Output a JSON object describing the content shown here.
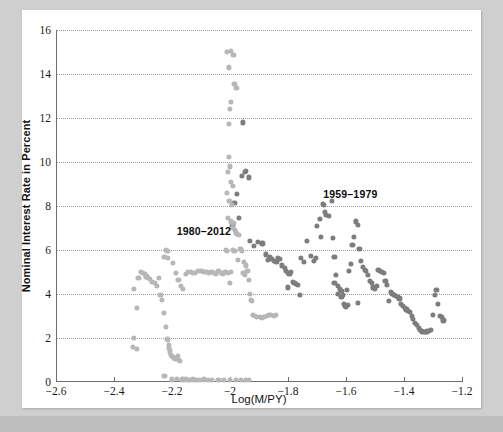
{
  "chart_data": {
    "type": "scatter",
    "title": "",
    "xlabel": "Log(M/PY)",
    "ylabel": "Nominal Interest Rate in Percent",
    "xlim": [
      -2.6,
      -1.2
    ],
    "ylim": [
      0,
      16
    ],
    "xticks": [
      -2.6,
      -2.4,
      -2.2,
      -2.0,
      -1.8,
      -1.6,
      -1.4,
      -1.2
    ],
    "xtick_labels": [
      "−2.6",
      "−2.4",
      "−2.2",
      "−2",
      "−1.8",
      "−1.6",
      "−1.4",
      "−1.2"
    ],
    "yticks": [
      0,
      2,
      4,
      6,
      8,
      10,
      12,
      14,
      16
    ],
    "ytick_labels": [
      "0",
      "2",
      "4",
      "6",
      "8",
      "10",
      "12",
      "14",
      "16"
    ],
    "grid": "horizontal-dotted",
    "legend_position": "inline-annotations",
    "annotations": [
      {
        "text": "1980–2012",
        "x": -2.09,
        "y": 6.85,
        "color": "#0d0d0d"
      },
      {
        "text": "1959–1979",
        "x": -1.585,
        "y": 8.55,
        "color": "#0d0d0d"
      }
    ],
    "series": [
      {
        "name": "1959–1979",
        "color": "#7d7d7d",
        "points": [
          [
            -1.955,
            11.8
          ],
          [
            -1.945,
            9.6
          ],
          [
            -1.95,
            9.55
          ],
          [
            -1.96,
            9.35
          ],
          [
            -1.935,
            9.3
          ],
          [
            -1.975,
            8.55
          ],
          [
            -1.985,
            8.15
          ],
          [
            -1.97,
            7.45
          ],
          [
            -1.992,
            7.1
          ],
          [
            -1.93,
            6.4
          ],
          [
            -1.905,
            6.35
          ],
          [
            -1.918,
            6.2
          ],
          [
            -1.888,
            6.3
          ],
          [
            -1.875,
            5.8
          ],
          [
            -1.862,
            5.7
          ],
          [
            -1.855,
            5.6
          ],
          [
            -1.868,
            5.55
          ],
          [
            -1.848,
            5.5
          ],
          [
            -1.84,
            5.45
          ],
          [
            -1.836,
            5.62
          ],
          [
            -1.828,
            5.58
          ],
          [
            -1.82,
            5.3
          ],
          [
            -1.812,
            5.2
          ],
          [
            -1.806,
            5.05
          ],
          [
            -1.8,
            4.95
          ],
          [
            -1.795,
            4.9
          ],
          [
            -1.79,
            5.0
          ],
          [
            -1.784,
            4.55
          ],
          [
            -1.778,
            4.5
          ],
          [
            -1.772,
            4.45
          ],
          [
            -1.766,
            4.4
          ],
          [
            -1.76,
            3.95
          ],
          [
            -1.8,
            4.3
          ],
          [
            -1.755,
            5.65
          ],
          [
            -1.745,
            5.45
          ],
          [
            -1.735,
            6.4
          ],
          [
            -1.722,
            5.75
          ],
          [
            -1.712,
            5.5
          ],
          [
            -1.7,
            7.1
          ],
          [
            -1.69,
            7.4
          ],
          [
            -1.68,
            8.1
          ],
          [
            -1.676,
            8.05
          ],
          [
            -1.672,
            7.75
          ],
          [
            -1.668,
            7.6
          ],
          [
            -1.66,
            7.55
          ],
          [
            -1.65,
            8.25
          ],
          [
            -1.646,
            6.55
          ],
          [
            -1.64,
            5.7
          ],
          [
            -1.634,
            4.85
          ],
          [
            -1.628,
            4.35
          ],
          [
            -1.622,
            4.25
          ],
          [
            -1.616,
            4.15
          ],
          [
            -1.61,
            3.95
          ],
          [
            -1.604,
            3.45
          ],
          [
            -1.6,
            3.4
          ],
          [
            -1.596,
            4.2
          ],
          [
            -1.59,
            5.05
          ],
          [
            -1.584,
            5.35
          ],
          [
            -1.578,
            6.25
          ],
          [
            -1.572,
            6.6
          ],
          [
            -1.566,
            7.3
          ],
          [
            -1.56,
            7.15
          ],
          [
            -1.554,
            6.05
          ],
          [
            -1.548,
            5.5
          ],
          [
            -1.542,
            5.25
          ],
          [
            -1.536,
            5.1
          ],
          [
            -1.53,
            5.05
          ],
          [
            -1.524,
            4.85
          ],
          [
            -1.518,
            4.6
          ],
          [
            -1.512,
            4.5
          ],
          [
            -1.506,
            4.3
          ],
          [
            -1.5,
            4.25
          ],
          [
            -1.494,
            4.35
          ],
          [
            -1.488,
            5.1
          ],
          [
            -1.482,
            5.05
          ],
          [
            -1.476,
            5.0
          ],
          [
            -1.47,
            4.95
          ],
          [
            -1.464,
            4.6
          ],
          [
            -1.458,
            4.4
          ],
          [
            -1.452,
            3.7
          ],
          [
            -1.446,
            4.1
          ],
          [
            -1.44,
            4.0
          ],
          [
            -1.434,
            3.95
          ],
          [
            -1.428,
            3.9
          ],
          [
            -1.422,
            3.85
          ],
          [
            -1.416,
            3.8
          ],
          [
            -1.41,
            3.55
          ],
          [
            -1.404,
            3.45
          ],
          [
            -1.398,
            3.35
          ],
          [
            -1.392,
            3.3
          ],
          [
            -1.386,
            3.25
          ],
          [
            -1.38,
            3.2
          ],
          [
            -1.374,
            3.0
          ],
          [
            -1.368,
            2.85
          ],
          [
            -1.362,
            2.7
          ],
          [
            -1.356,
            2.6
          ],
          [
            -1.35,
            2.45
          ],
          [
            -1.344,
            2.35
          ],
          [
            -1.338,
            2.3
          ],
          [
            -1.332,
            2.28
          ],
          [
            -1.326,
            2.26
          ],
          [
            -1.32,
            2.3
          ],
          [
            -1.314,
            2.32
          ],
          [
            -1.308,
            2.35
          ],
          [
            -1.3,
            3.05
          ],
          [
            -1.294,
            3.95
          ],
          [
            -1.288,
            4.2
          ],
          [
            -1.282,
            3.55
          ],
          [
            -1.276,
            3.0
          ],
          [
            -1.27,
            2.95
          ],
          [
            -1.264,
            2.8
          ],
          [
            -1.56,
            3.6
          ],
          [
            -1.594,
            3.5
          ],
          [
            -1.606,
            3.55
          ],
          [
            -1.64,
            4.5
          ],
          [
            -1.628,
            4.0
          ],
          [
            -1.616,
            3.85
          ],
          [
            -1.686,
            6.6
          ],
          [
            -1.704,
            5.65
          ]
        ]
      },
      {
        "name": "1980–2012",
        "color": "#b7b7b7",
        "points": [
          [
            -2.332,
            2.0
          ],
          [
            -2.336,
            1.6
          ],
          [
            -2.322,
            1.5
          ],
          [
            -2.32,
            3.35
          ],
          [
            -2.33,
            4.25
          ],
          [
            -2.316,
            4.75
          ],
          [
            -2.308,
            5.0
          ],
          [
            -2.3,
            4.95
          ],
          [
            -2.294,
            4.9
          ],
          [
            -2.288,
            4.8
          ],
          [
            -2.282,
            4.75
          ],
          [
            -2.276,
            4.7
          ],
          [
            -2.268,
            4.55
          ],
          [
            -2.26,
            4.5
          ],
          [
            -2.252,
            4.35
          ],
          [
            -2.246,
            4.75
          ],
          [
            -2.24,
            3.95
          ],
          [
            -2.234,
            3.75
          ],
          [
            -2.228,
            3.15
          ],
          [
            -2.222,
            2.5
          ],
          [
            -2.216,
            1.95
          ],
          [
            -2.214,
            1.9
          ],
          [
            -2.212,
            1.7
          ],
          [
            -2.21,
            1.55
          ],
          [
            -2.208,
            1.45
          ],
          [
            -2.206,
            1.35
          ],
          [
            -2.204,
            1.25
          ],
          [
            -2.2,
            1.2
          ],
          [
            -2.196,
            1.15
          ],
          [
            -2.192,
            1.1
          ],
          [
            -2.188,
            1.05
          ],
          [
            -2.184,
            1.1
          ],
          [
            -2.18,
            1.2
          ],
          [
            -2.176,
            1.0
          ],
          [
            -2.172,
            0.95
          ],
          [
            -2.22,
            6.0
          ],
          [
            -2.216,
            5.95
          ],
          [
            -2.226,
            5.7
          ],
          [
            -2.214,
            5.65
          ],
          [
            -2.196,
            5.4
          ],
          [
            -2.186,
            4.95
          ],
          [
            -2.178,
            4.65
          ],
          [
            -2.17,
            4.35
          ],
          [
            -2.162,
            4.25
          ],
          [
            -2.152,
            4.9
          ],
          [
            -2.144,
            5.0
          ],
          [
            -2.136,
            5.0
          ],
          [
            -2.128,
            4.95
          ],
          [
            -2.12,
            4.95
          ],
          [
            -2.112,
            5.05
          ],
          [
            -2.104,
            5.05
          ],
          [
            -2.096,
            5.05
          ],
          [
            -2.088,
            5.0
          ],
          [
            -2.08,
            5.0
          ],
          [
            -2.072,
            4.95
          ],
          [
            -2.064,
            5.0
          ],
          [
            -2.056,
            4.95
          ],
          [
            -2.048,
            4.9
          ],
          [
            -2.04,
            5.05
          ],
          [
            -2.032,
            4.95
          ],
          [
            -2.024,
            4.9
          ],
          [
            -2.016,
            5.0
          ],
          [
            -2.008,
            4.95
          ],
          [
            -2.0,
            4.5
          ],
          [
            -1.996,
            5.0
          ],
          [
            -1.99,
            6.0
          ],
          [
            -1.985,
            5.95
          ],
          [
            -2.226,
            0.28
          ],
          [
            -2.2,
            0.12
          ],
          [
            -2.182,
            0.14
          ],
          [
            -2.164,
            0.12
          ],
          [
            -2.152,
            0.12
          ],
          [
            -2.14,
            0.1
          ],
          [
            -2.128,
            0.12
          ],
          [
            -2.116,
            0.1
          ],
          [
            -2.104,
            0.1
          ],
          [
            -2.09,
            0.12
          ],
          [
            -2.076,
            0.1
          ],
          [
            -2.062,
            0.1
          ],
          [
            -2.04,
            0.08
          ],
          [
            -2.02,
            0.08
          ],
          [
            -2.0,
            0.08
          ],
          [
            -1.98,
            0.1
          ],
          [
            -1.962,
            0.08
          ],
          [
            -1.946,
            0.08
          ],
          [
            -1.934,
            0.08
          ],
          [
            -2.01,
            15.0
          ],
          [
            -1.998,
            15.05
          ],
          [
            -1.988,
            14.85
          ],
          [
            -2.004,
            14.3
          ],
          [
            -1.985,
            13.55
          ],
          [
            -1.978,
            13.35
          ],
          [
            -1.998,
            12.75
          ],
          [
            -2.0,
            12.4
          ],
          [
            -2.004,
            11.75
          ],
          [
            -2.003,
            10.25
          ],
          [
            -2.0,
            9.8
          ],
          [
            -2.008,
            9.55
          ],
          [
            -1.996,
            9.1
          ],
          [
            -1.99,
            8.9
          ],
          [
            -2.01,
            8.6
          ],
          [
            -2.002,
            8.25
          ],
          [
            -1.994,
            8.05
          ],
          [
            -2.006,
            7.45
          ],
          [
            -1.998,
            7.3
          ],
          [
            -1.988,
            7.25
          ],
          [
            -1.992,
            7.0
          ],
          [
            -1.984,
            6.9
          ],
          [
            -1.98,
            6.8
          ],
          [
            -1.976,
            6.75
          ],
          [
            -1.968,
            6.7
          ],
          [
            -1.964,
            6.05
          ],
          [
            -1.958,
            5.95
          ],
          [
            -1.952,
            5.45
          ],
          [
            -1.946,
            5.3
          ],
          [
            -1.94,
            5.05
          ],
          [
            -1.936,
            4.65
          ],
          [
            -1.932,
            4.0
          ],
          [
            -1.928,
            3.75
          ],
          [
            -1.924,
            3.7
          ],
          [
            -1.92,
            3.05
          ],
          [
            -1.914,
            3.0
          ],
          [
            -1.906,
            2.95
          ],
          [
            -1.898,
            2.95
          ],
          [
            -1.89,
            2.9
          ],
          [
            -1.882,
            2.95
          ],
          [
            -1.874,
            3.0
          ],
          [
            -1.866,
            3.05
          ],
          [
            -1.858,
            3.05
          ],
          [
            -1.85,
            3.0
          ],
          [
            -1.842,
            3.05
          ],
          [
            -2.014,
            6.0
          ],
          [
            -2.012,
            5.95
          ],
          [
            -1.972,
            5.55
          ],
          [
            -1.956,
            4.95
          ],
          [
            -1.95,
            4.85
          ]
        ]
      }
    ]
  }
}
